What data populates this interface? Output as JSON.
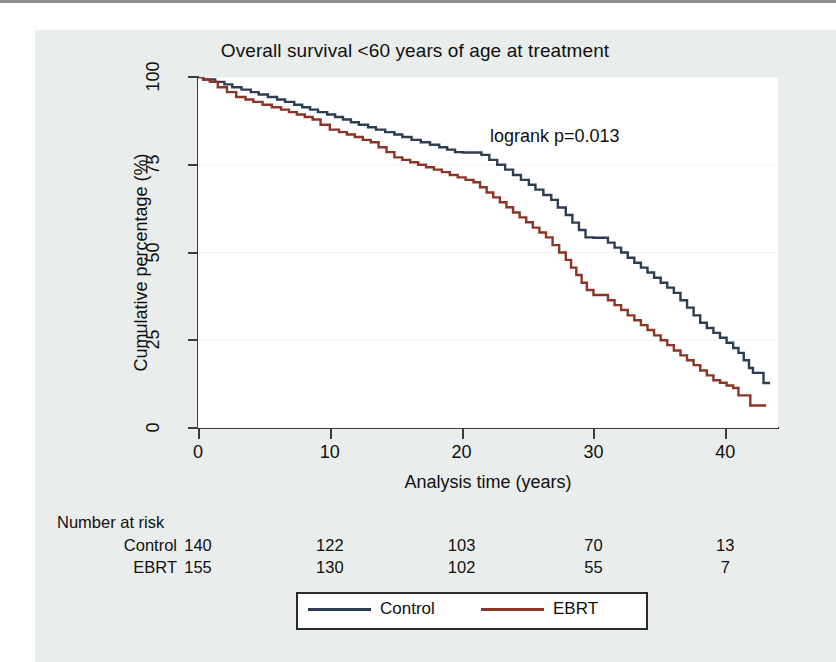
{
  "figure": {
    "background_color": "#e9edeb",
    "plot_background_color": "#ffffff",
    "axis_color": "#3c3c3c"
  },
  "chart_data": {
    "type": "line",
    "subtype": "kaplan-meier-survival",
    "title": "Overall survival <60 years of age at treatment",
    "xlabel": "Analysis time (years)",
    "ylabel": "Cumulative percentage (%)",
    "xlim": [
      0,
      44
    ],
    "ylim": [
      0,
      100
    ],
    "xticks": [
      0,
      10,
      20,
      30,
      40
    ],
    "yticks": [
      0,
      25,
      50,
      75,
      100
    ],
    "xticklabels": [
      "0",
      "10",
      "20",
      "30",
      "40"
    ],
    "yticklabels": [
      "0",
      "25",
      "50",
      "75",
      "100"
    ],
    "grid": "faint horizontal gridlines at y ticks",
    "legend_position": "below plot, centered, boxed",
    "annotations": [
      {
        "text": "logrank p=0.013",
        "x": 26.5,
        "y": 84
      }
    ],
    "series": [
      {
        "name": "Control",
        "color": "#2d3d52",
        "points": [
          [
            0,
            100
          ],
          [
            0.4,
            99.3
          ],
          [
            0.9,
            99.3
          ],
          [
            1.3,
            98.6
          ],
          [
            2.0,
            97.9
          ],
          [
            2.6,
            97.1
          ],
          [
            3.3,
            96.4
          ],
          [
            4.0,
            95.7
          ],
          [
            4.6,
            95.0
          ],
          [
            5.3,
            94.3
          ],
          [
            6.0,
            93.6
          ],
          [
            6.6,
            92.9
          ],
          [
            7.3,
            92.1
          ],
          [
            7.9,
            91.4
          ],
          [
            8.5,
            90.7
          ],
          [
            9.1,
            90.0
          ],
          [
            9.8,
            89.3
          ],
          [
            10.4,
            88.6
          ],
          [
            11.0,
            87.9
          ],
          [
            11.6,
            87.1
          ],
          [
            12.2,
            86.4
          ],
          [
            12.9,
            85.7
          ],
          [
            13.5,
            85.0
          ],
          [
            14.2,
            84.3
          ],
          [
            14.9,
            83.6
          ],
          [
            15.5,
            82.9
          ],
          [
            16.2,
            82.1
          ],
          [
            16.9,
            81.4
          ],
          [
            17.6,
            80.7
          ],
          [
            18.3,
            80.0
          ],
          [
            18.9,
            79.3
          ],
          [
            19.5,
            78.6
          ],
          [
            20.1,
            78.5
          ],
          [
            20.8,
            78.5
          ],
          [
            21.5,
            77.8
          ],
          [
            22.1,
            76.4
          ],
          [
            22.7,
            75.0
          ],
          [
            23.3,
            73.6
          ],
          [
            23.9,
            72.1
          ],
          [
            24.5,
            70.7
          ],
          [
            25.1,
            69.3
          ],
          [
            25.6,
            67.9
          ],
          [
            26.2,
            66.4
          ],
          [
            26.8,
            65.0
          ],
          [
            27.3,
            62.8
          ],
          [
            27.9,
            60.7
          ],
          [
            28.4,
            58.5
          ],
          [
            28.9,
            56.4
          ],
          [
            29.4,
            54.3
          ],
          [
            30.0,
            54.2
          ],
          [
            30.6,
            54.2
          ],
          [
            31.1,
            52.8
          ],
          [
            31.6,
            51.4
          ],
          [
            32.1,
            50.0
          ],
          [
            32.6,
            48.5
          ],
          [
            33.1,
            47.1
          ],
          [
            33.6,
            45.7
          ],
          [
            34.1,
            44.3
          ],
          [
            34.6,
            42.8
          ],
          [
            35.1,
            41.4
          ],
          [
            35.6,
            40.0
          ],
          [
            36.1,
            38.5
          ],
          [
            36.6,
            36.4
          ],
          [
            37.1,
            34.3
          ],
          [
            37.6,
            32.1
          ],
          [
            38.1,
            30.0
          ],
          [
            38.6,
            28.5
          ],
          [
            39.1,
            27.1
          ],
          [
            39.6,
            25.7
          ],
          [
            40.1,
            24.3
          ],
          [
            40.6,
            22.8
          ],
          [
            41.0,
            21.4
          ],
          [
            41.4,
            19.3
          ],
          [
            41.8,
            17.1
          ],
          [
            42.1,
            15.7
          ],
          [
            42.6,
            15.7
          ],
          [
            42.9,
            12.8
          ],
          [
            43.4,
            12.8
          ]
        ]
      },
      {
        "name": "EBRT",
        "color": "#8b3526",
        "points": [
          [
            0,
            100
          ],
          [
            0.4,
            99.3
          ],
          [
            0.9,
            98.6
          ],
          [
            1.5,
            97.1
          ],
          [
            2.2,
            95.7
          ],
          [
            2.9,
            94.3
          ],
          [
            3.6,
            93.6
          ],
          [
            4.2,
            92.9
          ],
          [
            4.9,
            92.1
          ],
          [
            5.6,
            91.4
          ],
          [
            6.3,
            90.7
          ],
          [
            6.9,
            90.0
          ],
          [
            7.5,
            89.3
          ],
          [
            8.1,
            88.6
          ],
          [
            8.7,
            87.9
          ],
          [
            9.3,
            86.4
          ],
          [
            10.0,
            85.0
          ],
          [
            10.7,
            84.3
          ],
          [
            11.3,
            83.6
          ],
          [
            11.9,
            82.9
          ],
          [
            12.5,
            82.1
          ],
          [
            13.1,
            81.4
          ],
          [
            13.7,
            80.0
          ],
          [
            14.3,
            78.6
          ],
          [
            14.9,
            77.1
          ],
          [
            15.5,
            76.4
          ],
          [
            16.1,
            75.7
          ],
          [
            16.7,
            75.0
          ],
          [
            17.3,
            74.3
          ],
          [
            17.9,
            73.6
          ],
          [
            18.5,
            72.9
          ],
          [
            19.1,
            72.1
          ],
          [
            19.7,
            71.4
          ],
          [
            20.3,
            70.7
          ],
          [
            20.9,
            70.0
          ],
          [
            21.4,
            68.6
          ],
          [
            21.9,
            67.1
          ],
          [
            22.4,
            65.7
          ],
          [
            22.9,
            64.3
          ],
          [
            23.4,
            62.9
          ],
          [
            23.9,
            61.4
          ],
          [
            24.4,
            60.0
          ],
          [
            24.9,
            58.6
          ],
          [
            25.4,
            57.1
          ],
          [
            25.9,
            55.7
          ],
          [
            26.4,
            54.3
          ],
          [
            26.9,
            52.1
          ],
          [
            27.4,
            50.0
          ],
          [
            27.9,
            47.9
          ],
          [
            28.3,
            45.7
          ],
          [
            28.7,
            43.6
          ],
          [
            29.1,
            41.4
          ],
          [
            29.5,
            39.3
          ],
          [
            30.0,
            37.9
          ],
          [
            30.6,
            37.9
          ],
          [
            31.1,
            36.4
          ],
          [
            31.6,
            35.0
          ],
          [
            32.1,
            33.6
          ],
          [
            32.6,
            32.1
          ],
          [
            33.1,
            30.7
          ],
          [
            33.6,
            29.3
          ],
          [
            34.1,
            27.9
          ],
          [
            34.6,
            26.4
          ],
          [
            35.1,
            25.0
          ],
          [
            35.6,
            23.6
          ],
          [
            36.1,
            22.1
          ],
          [
            36.6,
            20.7
          ],
          [
            37.1,
            19.3
          ],
          [
            37.6,
            17.9
          ],
          [
            38.1,
            16.4
          ],
          [
            38.6,
            15.0
          ],
          [
            39.1,
            13.6
          ],
          [
            39.6,
            12.9
          ],
          [
            40.1,
            12.1
          ],
          [
            40.6,
            11.4
          ],
          [
            41.0,
            9.3
          ],
          [
            41.5,
            9.3
          ],
          [
            41.9,
            6.4
          ],
          [
            43.1,
            6.4
          ]
        ]
      }
    ],
    "risk_table": {
      "heading": "Number at risk",
      "times": [
        0,
        10,
        20,
        30,
        40
      ],
      "rows": [
        {
          "label": "Control",
          "values": [
            "140",
            "122",
            "103",
            "70",
            "13"
          ]
        },
        {
          "label": "EBRT",
          "values": [
            "155",
            "130",
            "102",
            "55",
            "7"
          ]
        }
      ]
    },
    "legend": [
      {
        "label": "Control",
        "color": "#2d3d52"
      },
      {
        "label": "EBRT",
        "color": "#8b3526"
      }
    ]
  }
}
